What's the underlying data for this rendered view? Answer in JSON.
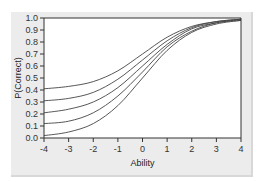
{
  "chart_data": {
    "type": "line",
    "title": "",
    "xlabel": "Ability",
    "ylabel": "P(Correct)",
    "xlim": [
      -4,
      4
    ],
    "ylim": [
      0,
      1
    ],
    "x_ticks": [
      "-4",
      "-3",
      "-2",
      "-1",
      "0",
      "1",
      "2",
      "3",
      "4"
    ],
    "y_ticks": [
      "0.0",
      "0.1",
      "0.2",
      "0.3",
      "0.4",
      "0.5",
      "0.6",
      "0.7",
      "0.8",
      "0.9",
      "1.0"
    ],
    "grid": false,
    "legend": "none",
    "x": [
      -4,
      -3,
      -2,
      -1,
      0,
      1,
      2,
      3,
      4
    ],
    "series": [
      {
        "name": "c=0.4",
        "values": [
          0.41,
          0.43,
          0.47,
          0.56,
          0.7,
          0.84,
          0.93,
          0.97,
          0.99
        ]
      },
      {
        "name": "c=0.3",
        "values": [
          0.31,
          0.33,
          0.38,
          0.49,
          0.65,
          0.81,
          0.92,
          0.97,
          0.99
        ]
      },
      {
        "name": "c=0.2",
        "values": [
          0.21,
          0.24,
          0.3,
          0.42,
          0.6,
          0.78,
          0.91,
          0.96,
          0.99
        ]
      },
      {
        "name": "c=0.1",
        "values": [
          0.12,
          0.14,
          0.21,
          0.35,
          0.55,
          0.76,
          0.89,
          0.96,
          0.98
        ]
      },
      {
        "name": "c=0.0",
        "values": [
          0.02,
          0.05,
          0.12,
          0.27,
          0.5,
          0.73,
          0.88,
          0.95,
          0.98
        ]
      }
    ]
  }
}
